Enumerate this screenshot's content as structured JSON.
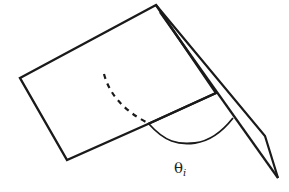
{
  "diagram": {
    "type": "geometry-illustration",
    "stroke_color": "#1a1a1a",
    "background": "#ffffff",
    "labels": {
      "angle_symbol": "θ",
      "angle_subscript": "i"
    },
    "shapes": {
      "main_plane": [
        [
          20,
          78
        ],
        [
          156,
          5
        ],
        [
          216,
          93
        ],
        [
          148,
          124
        ],
        [
          67,
          160
        ]
      ],
      "tilted_plane_outer": [
        [
          156,
          5
        ],
        [
          265,
          136
        ],
        [
          278,
          178
        ]
      ],
      "tilted_plane_inner": [
        [
          160,
          12
        ],
        [
          278,
          178
        ]
      ],
      "front_edge": [
        [
          148,
          124
        ],
        [
          216,
          93
        ]
      ],
      "dashed_arc": [
        [
          104,
          74
        ],
        [
          146,
          122
        ]
      ],
      "angle_arc": [
        [
          148,
          124
        ],
        [
          195,
          143
        ],
        [
          233,
          118
        ]
      ]
    }
  }
}
